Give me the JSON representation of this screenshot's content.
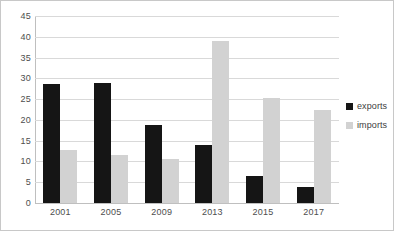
{
  "chart_data": {
    "type": "bar",
    "title": "",
    "subtitle": "",
    "xlabel": "",
    "ylabel": "",
    "categories": [
      "2001",
      "2005",
      "2009",
      "2013",
      "2015",
      "2017"
    ],
    "series": [
      {
        "name": "exports",
        "color": "#151515",
        "values": [
          28.7,
          29.0,
          18.7,
          14.0,
          6.5,
          3.8
        ]
      },
      {
        "name": "imports",
        "color": "#d2d2d2",
        "values": [
          12.7,
          11.5,
          10.5,
          39.0,
          25.2,
          22.3
        ]
      }
    ],
    "ylim": [
      0,
      45
    ],
    "ytick_step": 5,
    "yticks": [
      45,
      40,
      35,
      30,
      25,
      20,
      15,
      10,
      5,
      0
    ],
    "grid": true,
    "grid_color": "#d9d9d9",
    "legend_position": "right",
    "annotations": []
  },
  "legend": {
    "entries": [
      {
        "label": "exports"
      },
      {
        "label": "imports"
      }
    ]
  },
  "frame": {
    "border_color": "#c8c8c8",
    "background": "#ffffff"
  }
}
